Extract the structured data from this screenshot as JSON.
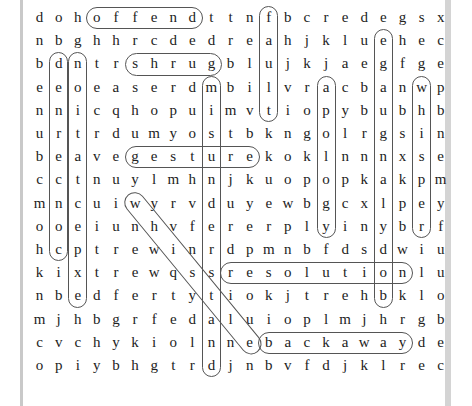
{
  "puzzle": {
    "rows": 16,
    "cols": 18,
    "grid": [
      "dohoffendttnfbcredegsx",
      "nbghhrcdedreahjklueheac",
      "bdntrshrugblujkjaegfge",
      "eeoeaserdmbilvracbanwp",
      "nnicqhopuimvtiopybubhb",
      "urtrdumyostbkngolrgsin",
      "beavegesturekoklnnnxse",
      "cctnuylmhnjkuopopkakpm",
      "mncuiwyrvduyewbgcxlpey",
      "ooeiunhvferrplyinybrf",
      "hcptrewinrdpmnbfdsdwiu",
      "kixtrewqssresolutionlu",
      "nbedfertytiokjtrehbklo",
      "mjhbgrfedaluioplmjhrgb",
      "cvchykiolnnebackawayde",
      "opiybhgtrdjnbvfdjklrec"
    ],
    "rows_cells": [
      [
        "d",
        "o",
        "h",
        "o",
        "f",
        "f",
        "e",
        "n",
        "d",
        "t",
        "t",
        "n",
        "f",
        "b",
        "c",
        "r",
        "e",
        "d",
        "e",
        "g",
        "s",
        "x"
      ],
      [
        "n",
        "b",
        "g",
        "h",
        "h",
        "r",
        "c",
        "d",
        "e",
        "d",
        "r",
        "e",
        "a",
        "h",
        "j",
        "k",
        "l",
        "u",
        "e",
        "h",
        "e",
        "c"
      ],
      [
        "b",
        "d",
        "n",
        "t",
        "r",
        "s",
        "h",
        "r",
        "u",
        "g",
        "b",
        "l",
        "u",
        "j",
        "k",
        "j",
        "a",
        "e",
        "g",
        "f",
        "g",
        "e"
      ],
      [
        "e",
        "e",
        "o",
        "e",
        "a",
        "s",
        "e",
        "r",
        "d",
        "m",
        "b",
        "i",
        "l",
        "v",
        "r",
        "a",
        "c",
        "b",
        "a",
        "n",
        "w",
        "p"
      ],
      [
        "n",
        "n",
        "i",
        "c",
        "q",
        "h",
        "o",
        "p",
        "u",
        "i",
        "m",
        "v",
        "t",
        "i",
        "o",
        "p",
        "y",
        "b",
        "u",
        "b",
        "h",
        "b"
      ],
      [
        "u",
        "r",
        "t",
        "r",
        "d",
        "u",
        "m",
        "y",
        "o",
        "s",
        "t",
        "b",
        "k",
        "n",
        "g",
        "o",
        "l",
        "r",
        "g",
        "s",
        "i",
        "n"
      ],
      [
        "b",
        "e",
        "a",
        "v",
        "e",
        "g",
        "e",
        "s",
        "t",
        "u",
        "r",
        "e",
        "k",
        "o",
        "k",
        "l",
        "n",
        "n",
        "n",
        "x",
        "s",
        "e"
      ],
      [
        "c",
        "c",
        "t",
        "n",
        "u",
        "y",
        "l",
        "m",
        "h",
        "n",
        "j",
        "k",
        "u",
        "o",
        "p",
        "o",
        "p",
        "k",
        "a",
        "k",
        "p",
        "m"
      ],
      [
        "m",
        "n",
        "c",
        "u",
        "i",
        "w",
        "y",
        "r",
        "v",
        "d",
        "u",
        "y",
        "e",
        "w",
        "b",
        "g",
        "c",
        "x",
        "l",
        "p",
        "e",
        "y"
      ],
      [
        "o",
        "o",
        "e",
        "i",
        "u",
        "n",
        "h",
        "v",
        "f",
        "e",
        "r",
        "e",
        "r",
        "p",
        "l",
        "y",
        "i",
        "n",
        "y",
        "b",
        "r",
        "f"
      ],
      [
        "h",
        "c",
        "p",
        "t",
        "r",
        "e",
        "w",
        "i",
        "n",
        "r",
        "d",
        "p",
        "m",
        "n",
        "b",
        "f",
        "d",
        "s",
        "d",
        "w",
        "i",
        "u"
      ],
      [
        "k",
        "i",
        "x",
        "t",
        "r",
        "e",
        "w",
        "q",
        "s",
        "s",
        "r",
        "e",
        "s",
        "o",
        "l",
        "u",
        "t",
        "i",
        "o",
        "n",
        "l",
        "u"
      ],
      [
        "n",
        "b",
        "e",
        "d",
        "f",
        "e",
        "r",
        "t",
        "y",
        "t",
        "i",
        "o",
        "k",
        "j",
        "t",
        "r",
        "e",
        "h",
        "b",
        "k",
        "l",
        "o"
      ],
      [
        "m",
        "j",
        "h",
        "b",
        "g",
        "r",
        "f",
        "e",
        "d",
        "a",
        "l",
        "u",
        "i",
        "o",
        "p",
        "l",
        "m",
        "j",
        "h",
        "r",
        "g",
        "b"
      ],
      [
        "c",
        "v",
        "c",
        "h",
        "y",
        "k",
        "i",
        "o",
        "l",
        "n",
        "n",
        "e",
        "b",
        "a",
        "c",
        "k",
        "a",
        "w",
        "a",
        "y",
        "d",
        "e"
      ],
      [
        "o",
        "p",
        "i",
        "y",
        "b",
        "h",
        "g",
        "t",
        "r",
        "d",
        "j",
        "n",
        "b",
        "v",
        "f",
        "d",
        "j",
        "k",
        "l",
        "r",
        "e",
        "c"
      ]
    ],
    "found_words": [
      {
        "word": "offend",
        "direction": "horizontal",
        "row": 0,
        "col_start": 3,
        "col_end": 8
      },
      {
        "word": "shrug",
        "direction": "horizontal",
        "row": 2,
        "col_start": 5,
        "col_end": 9
      },
      {
        "word": "gesture",
        "direction": "horizontal",
        "row": 6,
        "col_start": 5,
        "col_end": 11
      },
      {
        "word": "resolution",
        "direction": "horizontal",
        "row": 11,
        "col_start": 10,
        "col_end": 19
      },
      {
        "word": "backaway",
        "direction": "horizontal",
        "row": 14,
        "col_start": 12,
        "col_end": 19
      },
      {
        "word": "fault",
        "direction": "vertical",
        "col": 12,
        "row_start": 0,
        "row_end": 4
      },
      {
        "word": "denounce",
        "direction": "vertical",
        "col": 1,
        "row_start": 2,
        "row_end": 10
      },
      {
        "word": "nottaken",
        "direction": "vertical",
        "col": 2,
        "row_start": 2,
        "row_end": 12
      },
      {
        "word": "misunderstand",
        "direction": "vertical",
        "col": 9,
        "row_start": 3,
        "row_end": 15
      },
      {
        "word": "apology",
        "direction": "vertical",
        "col": 15,
        "row_start": 3,
        "row_end": 9
      },
      {
        "word": "whisper",
        "direction": "vertical",
        "col": 20,
        "row_start": 3,
        "row_end": 9
      },
      {
        "word": "bodylanguage",
        "direction": "vertical-up",
        "col": 18,
        "row_start": 12,
        "row_end": 1
      },
      {
        "word": "wherewithal",
        "direction": "diagonal",
        "row_start": 8,
        "col_start": 5,
        "row_end": 14,
        "col_end": 11
      }
    ]
  }
}
